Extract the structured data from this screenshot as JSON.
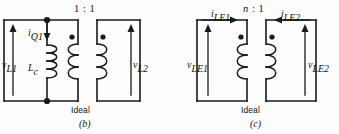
{
  "figure": {
    "background_color": "#fdfdfd",
    "line_color": "#1a1a1a",
    "panels": [
      {
        "id": "b",
        "caption": "(b)",
        "transformer_label": "Ideal",
        "turns_ratio": "1 : 1",
        "ratio_left": "1",
        "ratio_sep": ":",
        "ratio_right": "1",
        "left_voltage": {
          "symbol": "v",
          "subscript": "L1",
          "direction": "up"
        },
        "right_voltage": {
          "symbol": "v",
          "subscript": "L2",
          "direction": "up"
        },
        "shunt_current": {
          "symbol": "i",
          "subscript": "Q1",
          "direction": "down"
        },
        "inductor": {
          "symbol": "L",
          "subscript": "c"
        },
        "dots": 2,
        "windings": 2
      },
      {
        "id": "c",
        "caption": "(c)",
        "transformer_label": "Ideal",
        "turns_ratio": "n : 1",
        "ratio_left": "n",
        "ratio_sep": ":",
        "ratio_right": "1",
        "left_voltage": {
          "symbol": "v",
          "subscript": "LE1",
          "direction": "up"
        },
        "right_voltage": {
          "symbol": "v",
          "subscript": "LE2",
          "direction": "up"
        },
        "left_current": {
          "symbol": "i",
          "subscript": "LE1",
          "direction": "right"
        },
        "right_current": {
          "symbol": "i",
          "subscript": "LE2",
          "direction": "left"
        },
        "dots": 2,
        "windings": 2
      }
    ]
  }
}
